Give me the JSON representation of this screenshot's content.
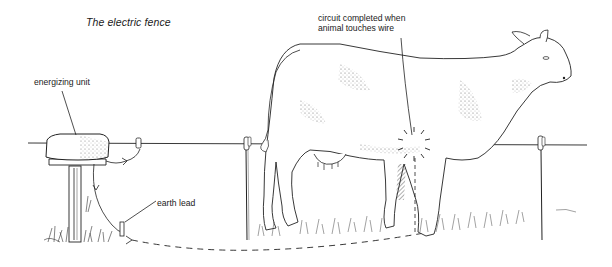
{
  "diagram": {
    "title": "The electric fence",
    "labels": {
      "energizing_unit": "energizing unit",
      "earth_lead": "earth lead",
      "circuit_line1": "circuit completed when",
      "circuit_line2": "animal touches wire"
    },
    "components": [
      {
        "id": "energizing-unit",
        "description": "box-shaped energizer mounted on wooden post"
      },
      {
        "id": "fence-wire",
        "description": "horizontal live wire"
      },
      {
        "id": "fence-post-left",
        "description": "thin post with insulator"
      },
      {
        "id": "fence-post-right",
        "description": "thin post with insulator"
      },
      {
        "id": "earth-rod",
        "description": "earth lead rod in ground"
      },
      {
        "id": "cow",
        "description": "cow touching wire with chest/foreleg"
      },
      {
        "id": "spark",
        "description": "contact point where circuit is completed"
      },
      {
        "id": "return-path",
        "description": "dashed line through ground back to earth rod"
      }
    ],
    "colors": {
      "ink": "#1a1a1a",
      "background": "#ffffff",
      "stipple": "#7a7a7a"
    }
  }
}
